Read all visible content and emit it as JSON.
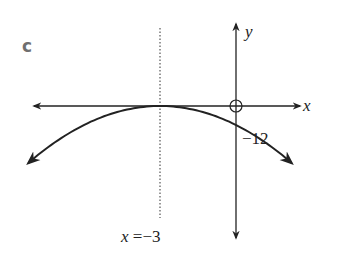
{
  "part_label": "c",
  "axes": {
    "x_label": "x",
    "y_label": "y",
    "origin_marker": "open-circle"
  },
  "curve": {
    "type": "parabola",
    "opens": "down",
    "vertex": [
      -3,
      0
    ],
    "y_intercept": -12
  },
  "annotations": {
    "y_intercept_label": "−12",
    "axis_of_symmetry_label_var": "x",
    "axis_of_symmetry_label_rest": " =−3"
  },
  "colors": {
    "ink": "#222222",
    "part_label": "#6f6f6f"
  }
}
